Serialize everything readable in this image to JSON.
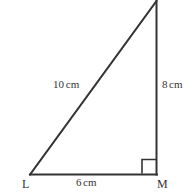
{
  "figure": {
    "type": "right-triangle-diagram",
    "stroke_color": "#333333",
    "background_color": "#ffffff",
    "vertices": {
      "L": {
        "label": "L",
        "x": 30,
        "y": 175
      },
      "M": {
        "label": "M",
        "x": 157,
        "y": 175
      },
      "apex": {
        "label": "",
        "x": 157,
        "y": 1
      }
    },
    "right_angle": {
      "at_vertex": "M",
      "marker": "square",
      "size": 14
    },
    "sides": [
      {
        "name": "hypotenuse",
        "from": "L",
        "to": "apex",
        "value": "10",
        "unit": "cm",
        "label": "10cm"
      },
      {
        "name": "vertical",
        "from": "M",
        "to": "apex",
        "value": "8",
        "unit": "cm",
        "label": "8cm"
      },
      {
        "name": "base",
        "from": "L",
        "to": "M",
        "value": "6",
        "unit": "cm",
        "label": "6cm"
      }
    ]
  },
  "labels": {
    "hypotenuse_value": "10",
    "hypotenuse_unit": "cm",
    "vertical_value": "8",
    "vertical_unit": "cm",
    "base_value": "6",
    "base_unit": "cm",
    "vertex_l": "L",
    "vertex_m": "M"
  }
}
